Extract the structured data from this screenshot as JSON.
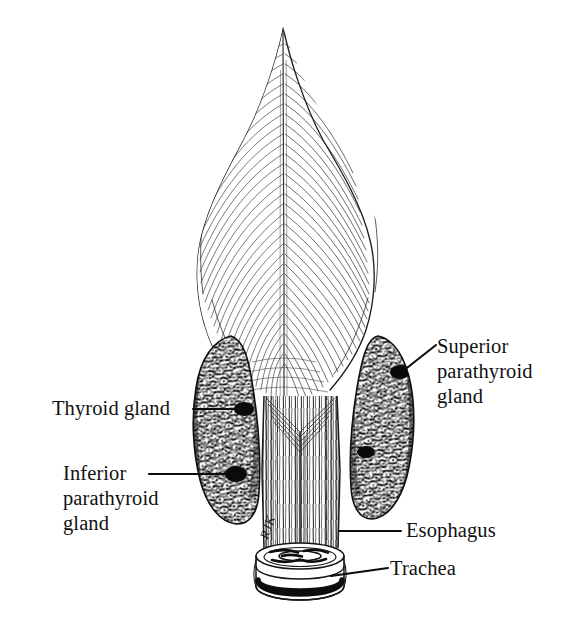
{
  "figure": {
    "background_color": "#ffffff",
    "ink_color": "#111111",
    "width": 576,
    "height": 623,
    "signature": "RJK"
  },
  "labels": [
    {
      "id": "superior-parathyroid",
      "text": "Superior\nparathyroid\ngland",
      "lines": [
        "Superior",
        "parathyroid",
        "gland"
      ],
      "leader": {
        "x1": 403,
        "y1": 371,
        "x2": 436,
        "y2": 345
      },
      "align": "left"
    },
    {
      "id": "thyroid-gland",
      "text": "Thyroid gland",
      "lines": [
        "Thyroid gland"
      ],
      "leader": {
        "x1": 248,
        "y1": 409,
        "x2": 193,
        "y2": 409
      },
      "align": "left"
    },
    {
      "id": "inferior-parathyroid",
      "text": "Inferior\nparathyroid\ngland",
      "lines": [
        "Inferior",
        "parathyroid",
        "gland"
      ],
      "leader": {
        "x1": 240,
        "y1": 474,
        "x2": 149,
        "y2": 474
      },
      "align": "left"
    },
    {
      "id": "esophagus",
      "text": "Esophagus",
      "lines": [
        "Esophagus"
      ],
      "leader": {
        "x1": 339,
        "y1": 531,
        "x2": 401,
        "y2": 531
      },
      "align": "left"
    },
    {
      "id": "trachea",
      "text": "Trachea",
      "lines": [
        "Trachea"
      ],
      "leader": {
        "x1": 331,
        "y1": 576,
        "x2": 388,
        "y2": 568
      },
      "align": "left"
    }
  ],
  "structures": {
    "larynx_pharynx": {
      "name": "pharyngeal constrictor muscles",
      "apex_x": 283,
      "apex_y": 27,
      "shading": "fine diagonal hatching with central midline raphe"
    },
    "thyroid_left_lobe": {
      "name": "thyroid gland left lobe",
      "cx": 225,
      "cy": 430,
      "rx": 30,
      "ry": 98,
      "texture": "dense mottled stipple"
    },
    "thyroid_right_lobe": {
      "name": "thyroid gland right lobe",
      "cx": 387,
      "cy": 425,
      "rx": 29,
      "ry": 95,
      "texture": "dense mottled stipple"
    },
    "esophagus_column": {
      "name": "esophagus",
      "cx": 300,
      "top_y": 400,
      "bottom_y": 545,
      "texture": "vertical striations"
    },
    "trachea_rings": {
      "name": "trachea",
      "cx": 300,
      "cy": 570,
      "rings": 2
    }
  }
}
